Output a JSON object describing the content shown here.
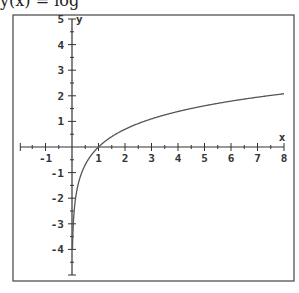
{
  "header_fragment": "y(x) = log",
  "chart_data": {
    "type": "line",
    "title": "",
    "function": "y = ln(x) (natural log curve)",
    "xlabel": "x",
    "ylabel": "y",
    "xlim": [
      -1.8,
      8
    ],
    "ylim": [
      -5,
      5
    ],
    "x_ticks": [
      "-1",
      "1",
      "2",
      "3",
      "4",
      "5",
      "6",
      "7",
      "8"
    ],
    "y_ticks": [
      "5",
      "4",
      "3",
      "2",
      "1",
      "-1",
      "-2",
      "-3",
      "-4"
    ],
    "grid": false,
    "series": [
      {
        "name": "f(x)",
        "x": [
          0.02,
          0.05,
          0.1,
          0.2,
          0.3,
          0.5,
          0.75,
          1,
          1.5,
          2,
          3,
          4,
          5,
          6,
          7,
          8
        ],
        "y": [
          -3.9,
          -3.0,
          -2.3,
          -1.61,
          -1.2,
          -0.69,
          -0.29,
          0,
          0.41,
          0.69,
          1.1,
          1.39,
          1.61,
          1.79,
          1.95,
          2.08
        ]
      }
    ],
    "colors": {
      "axis": "#333333",
      "curve": "#555555",
      "frame": "#444444"
    }
  }
}
